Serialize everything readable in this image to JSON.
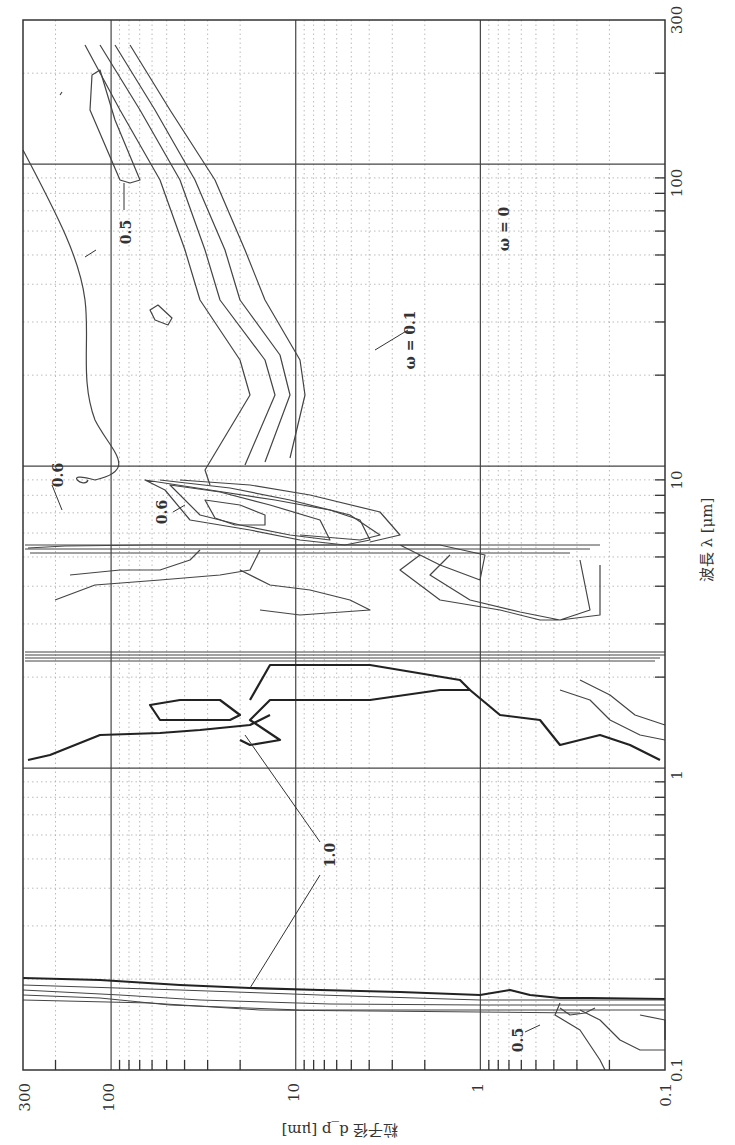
{
  "chart_data": {
    "type": "heatmap",
    "subtype": "contour",
    "title": "",
    "orientation": "rotated 90 degrees (figure printed sideways)",
    "xlabel": "粒子径 d_p [μm]",
    "ylabel": "波長 λ [μm]",
    "x_axis": {
      "label": "粒子径 d_p [μm]",
      "scale": "log",
      "range": [
        0.1,
        300
      ],
      "ticks": [
        "300",
        "100",
        "10",
        "1",
        "0.1"
      ]
    },
    "y_axis": {
      "label": "波長 λ [μm]",
      "scale": "log",
      "range": [
        0.1,
        300
      ],
      "ticks": [
        "300",
        "100",
        "10",
        "1",
        "0.1"
      ]
    },
    "grid": {
      "major": true,
      "minor": "dotted"
    },
    "contour_variable": "ω (single scattering albedo)",
    "contour_levels": [
      0,
      0.1,
      0.2,
      0.3,
      0.4,
      0.5,
      0.6,
      0.7,
      0.8,
      0.9,
      1.0
    ],
    "annotations": [
      {
        "text": "0.5",
        "near": {
          "dp": 100,
          "lambda": 45
        }
      },
      {
        "text": "ω = 0.1",
        "near": {
          "dp": 2,
          "lambda": 25
        }
      },
      {
        "text": "ω = 0",
        "near": {
          "dp": 0.8,
          "lambda": 60
        }
      },
      {
        "text": "0.6",
        "near": {
          "dp": 200,
          "lambda": 8
        }
      },
      {
        "text": "0.6",
        "near": {
          "dp": 35,
          "lambda": 8
        }
      },
      {
        "text": "1.0",
        "near": {
          "dp": 3,
          "lambda": 0.45
        }
      },
      {
        "text": "0.5",
        "near": {
          "dp": 0.7,
          "lambda": 0.12
        }
      }
    ],
    "features": [
      {
        "description": "ω=0 region (strong absorption) at large dp/low λ edge, small dp at long wavelength",
        "region": {
          "dp": [
            0.1,
            1
          ],
          "lambda": [
            10,
            300
          ]
        }
      },
      {
        "description": "ω≈1.0 (non-absorbing) bands",
        "region": {
          "dp": [
            0.1,
            300
          ],
          "lambda": [
            0.2,
            2.7
          ]
        }
      },
      {
        "description": "Absorption band near λ≈2.7–3 μm (dense contours)",
        "lambda": 2.8
      },
      {
        "description": "Absorption band near λ≈6 μm (dense contours)",
        "lambda": 6.1
      },
      {
        "description": "Sharp transition near λ≈0.2 μm",
        "lambda": 0.2
      }
    ]
  },
  "labels": {
    "x_axis_title": "粒子径  d_p [μm]",
    "y_axis_title": "波長  λ [μm]",
    "x_ticks": [
      "300",
      "100",
      "10",
      "1",
      "0.1"
    ],
    "y_ticks": [
      "300",
      "100",
      "10",
      "1",
      "0.1"
    ],
    "contour_labels": [
      "0.5",
      "ω = 0.1",
      "ω = 0",
      "0.6",
      "0.6",
      "1.0",
      "0.5"
    ]
  }
}
